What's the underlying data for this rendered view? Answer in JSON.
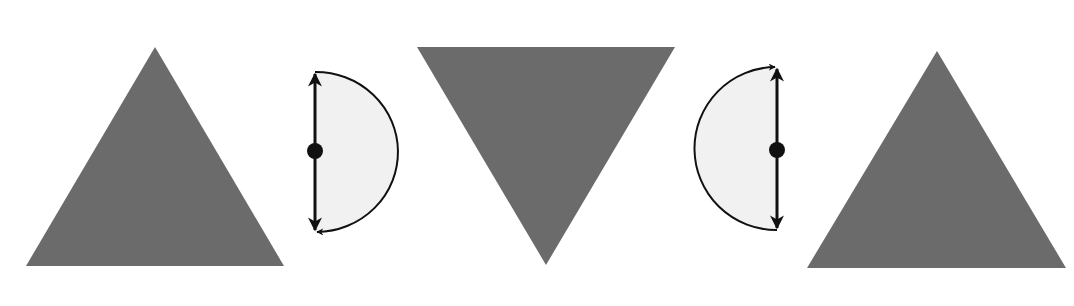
{
  "diagram": {
    "colors": {
      "triangle_fill": "#6b6b6b",
      "semicircle_fill": "#f1f1f1",
      "stroke": "#111111",
      "background": "#ffffff"
    },
    "shapes": [
      {
        "id": "triangle-1",
        "type": "triangle",
        "orientation": "up",
        "points": [
          [
            155,
            47
          ],
          [
            26,
            266
          ],
          [
            284,
            266
          ]
        ]
      },
      {
        "id": "rotation-1",
        "type": "rotation-symbol",
        "axis_x": 315,
        "top_y": 72,
        "bottom_y": 232,
        "pivot": [
          315,
          151
        ],
        "bulge": "right",
        "arc_arrow_at": "bottom"
      },
      {
        "id": "triangle-2",
        "type": "triangle",
        "orientation": "down",
        "points": [
          [
            417,
            47
          ],
          [
            675,
            47
          ],
          [
            546,
            265
          ]
        ]
      },
      {
        "id": "rotation-2",
        "type": "rotation-symbol",
        "axis_x": 777,
        "top_y": 67,
        "bottom_y": 230,
        "pivot": [
          777,
          150
        ],
        "bulge": "left",
        "arc_arrow_at": "top"
      },
      {
        "id": "triangle-3",
        "type": "triangle",
        "orientation": "up",
        "points": [
          [
            937,
            51
          ],
          [
            807,
            268
          ],
          [
            1066,
            268
          ]
        ]
      }
    ]
  }
}
